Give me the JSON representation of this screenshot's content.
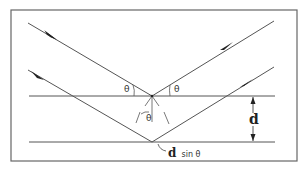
{
  "diagram": {
    "labels": {
      "theta_incident_upper": "θ",
      "theta_reflected_upper": "θ",
      "theta_inner": "θ",
      "spacing": "d",
      "path_difference_d": "d",
      "path_difference_rest": "sin θ"
    },
    "elements": {
      "planes": [
        "upper lattice plane",
        "lower lattice plane"
      ],
      "rays": [
        "upper incident ray",
        "upper reflected ray",
        "lower incident ray",
        "lower reflected ray"
      ],
      "dimension": "interplanar spacing arrow"
    },
    "colors": {
      "line": "#555555",
      "border": "#666666",
      "text": "#333333"
    }
  }
}
